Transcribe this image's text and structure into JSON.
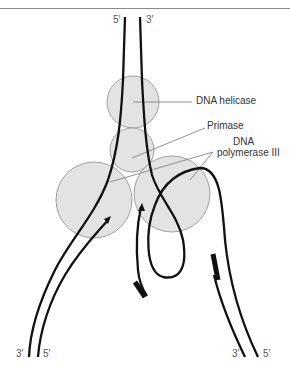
{
  "diagram": {
    "labels": {
      "helicase": "DNA helicase",
      "primase": "Primase",
      "polymerase_line1": "DNA",
      "polymerase_line2": "polymerase III"
    },
    "strand_ends": {
      "top_left": "5′",
      "top_right": "3′",
      "bottom_left_a": "3′",
      "bottom_left_b": "5′",
      "bottom_right_a": "3′",
      "bottom_right_b": "5′"
    },
    "colors": {
      "strand": "#111111",
      "protein_fill": "#e3e3e3",
      "protein_stroke": "#8c8c8c",
      "leader_line": "#777777",
      "label_text": "#333333"
    }
  }
}
